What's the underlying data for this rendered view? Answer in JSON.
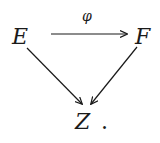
{
  "diagram": {
    "type": "commutative-diagram",
    "nodes": [
      {
        "id": "E",
        "label": "E"
      },
      {
        "id": "F",
        "label": "F"
      },
      {
        "id": "Z",
        "label": "Z"
      }
    ],
    "edges": [
      {
        "from": "E",
        "to": "F",
        "label": "φ"
      },
      {
        "from": "E",
        "to": "Z",
        "label": ""
      },
      {
        "from": "F",
        "to": "Z",
        "label": ""
      }
    ],
    "trailing_punctuation": "."
  }
}
